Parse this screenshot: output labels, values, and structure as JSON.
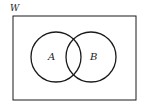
{
  "diagram": {
    "type": "venn",
    "universe_label": "W",
    "sets": [
      {
        "label": "A",
        "cx": 51,
        "cy": 57,
        "r": 17
      },
      {
        "label": "B",
        "cx": 90,
        "cy": 57,
        "r": 17
      }
    ],
    "colors": {
      "stroke": "#1a1a1a",
      "background": "#ffffff"
    }
  }
}
